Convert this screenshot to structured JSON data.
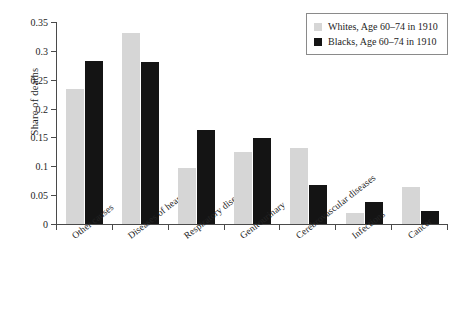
{
  "chart_data": {
    "type": "bar",
    "title": "",
    "xlabel": "",
    "ylabel": "Share of deaths",
    "ylim": [
      0,
      0.35
    ],
    "yticks": [
      "0",
      "0.05",
      "0.1",
      "0.15",
      "0.2",
      "0.25",
      "0.3",
      "0.35"
    ],
    "ytick_values": [
      0,
      0.05,
      0.1,
      0.15,
      0.2,
      0.25,
      0.3,
      0.35
    ],
    "grid": false,
    "legend_position": "top-right",
    "categories": [
      "Other causes",
      "Diseases of heart",
      "Respiratory diseases",
      "Genitourinary",
      "Cerebrovascular diseases",
      "Infections",
      "Cancer"
    ],
    "series": [
      {
        "name": "Whites, Age 60–74 in 1910",
        "color": "#d6d6d6",
        "values": [
          0.234,
          0.331,
          0.097,
          0.125,
          0.131,
          0.019,
          0.065
        ]
      },
      {
        "name": "Blacks, Age 60–74 in 1910",
        "color": "#141414",
        "values": [
          0.283,
          0.281,
          0.163,
          0.149,
          0.068,
          0.038,
          0.022
        ]
      }
    ]
  },
  "legend": {
    "items": [
      {
        "label": "Whites, Age 60–74 in 1910",
        "swatch": "whites"
      },
      {
        "label": "Blacks, Age 60–74 in 1910",
        "swatch": "blacks"
      }
    ]
  },
  "axes": {
    "y_title": "Share of deaths"
  }
}
